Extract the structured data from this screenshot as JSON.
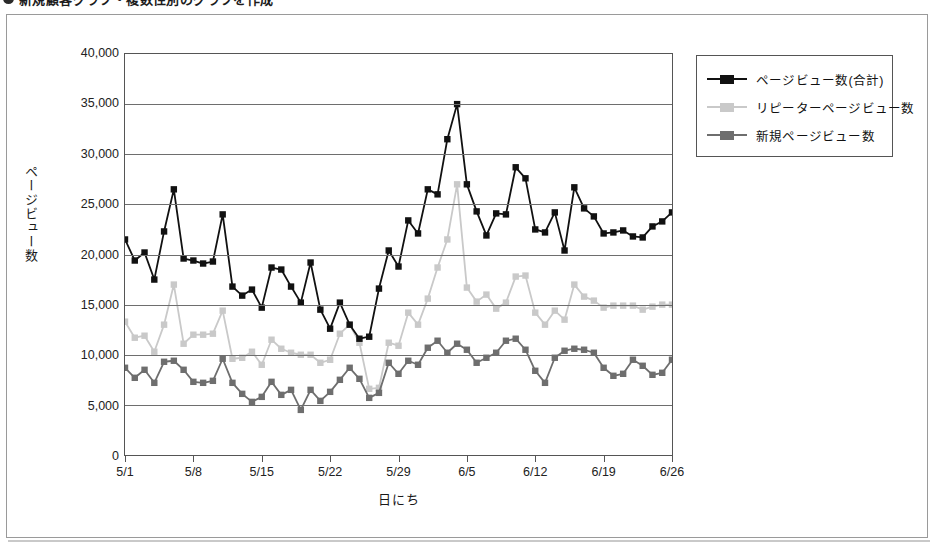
{
  "title": {
    "bullet": "bullet-icon",
    "text": "新規顧客グラフ・複数性別のグラフを作成"
  },
  "legend": {
    "position": "right",
    "items": [
      {
        "label": "ページビュー数(合計)",
        "color": "#111111",
        "key": "total"
      },
      {
        "label": "リピーターページビュー数",
        "color": "#c9c9c9",
        "key": "repeater"
      },
      {
        "label": "新規ページビュー数",
        "color": "#6e6e6e",
        "key": "new"
      }
    ]
  },
  "chart_data": {
    "type": "line",
    "title": "",
    "xlabel": "日にち",
    "ylabel": "ページビュー数",
    "ylim": [
      0,
      40000
    ],
    "ytick_step": 5000,
    "yticks": [
      "0",
      "5,000",
      "10,000",
      "15,000",
      "20,000",
      "25,000",
      "30,000",
      "35,000",
      "40,000"
    ],
    "ytick_values": [
      0,
      5000,
      10000,
      15000,
      20000,
      25000,
      30000,
      35000,
      40000
    ],
    "grid": true,
    "x_tick_labels": [
      "5/1",
      "5/8",
      "5/15",
      "5/22",
      "5/29",
      "6/5",
      "6/12",
      "6/19",
      "6/26"
    ],
    "x_tick_indices": [
      0,
      7,
      14,
      21,
      28,
      35,
      42,
      49,
      56
    ],
    "n_points": 57,
    "marker": "square",
    "series": [
      {
        "name": "ページビュー数(合計)",
        "color": "#111111",
        "values": [
          21500,
          19400,
          20200,
          17500,
          22300,
          26500,
          19600,
          19400,
          19100,
          19300,
          24000,
          16800,
          15900,
          16500,
          14700,
          18700,
          18500,
          16800,
          15200,
          19200,
          14500,
          12600,
          15200,
          13000,
          11600,
          11800,
          16600,
          20400,
          18800,
          23400,
          22100,
          26500,
          26000,
          31500,
          35000,
          27000,
          24300,
          21900,
          24100,
          24000,
          28700,
          27600,
          22500,
          22200,
          24200,
          20400,
          26700,
          24600,
          23800,
          22100,
          22200,
          22400,
          21800,
          21700,
          22800,
          23300,
          24200
        ]
      },
      {
        "name": "リピーターページビュー数",
        "color": "#c9c9c9",
        "values": [
          13300,
          11700,
          11900,
          10300,
          13000,
          17000,
          11100,
          12000,
          12000,
          12100,
          14400,
          9600,
          9700,
          10300,
          9000,
          11500,
          10600,
          10200,
          10000,
          10000,
          9200,
          9500,
          12100,
          13000,
          11200,
          6600,
          6700,
          11200,
          10900,
          14200,
          13000,
          15600,
          18700,
          21500,
          27000,
          16700,
          15300,
          16000,
          14600,
          15200,
          17800,
          17900,
          14200,
          13000,
          14400,
          13500,
          17000,
          15800,
          15400,
          14700,
          14900,
          14900,
          14900,
          14500,
          14800,
          15000,
          15000
        ]
      },
      {
        "name": "新規ページビュー数",
        "color": "#6e6e6e",
        "values": [
          8700,
          7700,
          8500,
          7200,
          9300,
          9400,
          8500,
          7300,
          7200,
          7400,
          9600,
          7200,
          6100,
          5300,
          5800,
          7300,
          6000,
          6500,
          4500,
          6500,
          5400,
          6300,
          7500,
          8700,
          7600,
          5700,
          6200,
          9200,
          8100,
          9400,
          9000,
          10700,
          11400,
          10200,
          11100,
          10500,
          9200,
          9700,
          10200,
          11400,
          11600,
          10500,
          8400,
          7200,
          9700,
          10400,
          10600,
          10500,
          10200,
          8700,
          7900,
          8100,
          9500,
          8900,
          8000,
          8200,
          9500
        ]
      }
    ]
  }
}
